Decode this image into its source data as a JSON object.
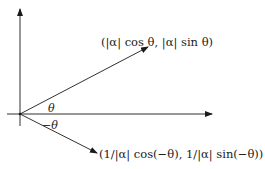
{
  "diagram": {
    "title": "",
    "labels": {
      "upper_point": "(|α| cos θ, |α| sin θ)",
      "lower_point": "(1/|α| cos(−θ), 1/|α| sin(−θ))",
      "angle_upper": "θ",
      "angle_lower": "−θ"
    },
    "elements": [
      {
        "type": "axis",
        "name": "x-axis",
        "direction": "horizontal"
      },
      {
        "type": "axis",
        "name": "y-axis",
        "direction": "vertical"
      },
      {
        "type": "vector",
        "name": "upper-vector",
        "angle": "θ"
      },
      {
        "type": "vector",
        "name": "lower-vector",
        "angle": "−θ"
      }
    ],
    "colors": {
      "stroke": "#1a1a1a",
      "background": "#ffffff"
    }
  }
}
